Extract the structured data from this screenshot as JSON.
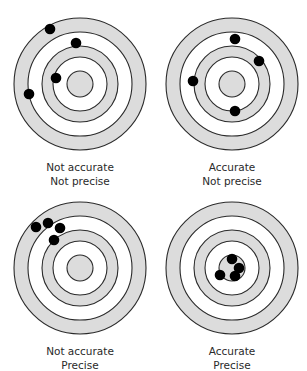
{
  "figure": {
    "colors": {
      "ring_fill": "#dcdcdc",
      "ring_gap": "#ffffff",
      "ring_stroke": "#2b2b2b",
      "dot": "#000000",
      "text": "#2a2a2a"
    },
    "rings": {
      "radii_px": [
        66,
        52,
        38,
        27,
        13
      ],
      "fills": [
        "shaded",
        "white",
        "shaded",
        "white",
        "shaded"
      ]
    },
    "panels": [
      {
        "id": "top-left",
        "center": [
          80,
          84
        ],
        "line1": "Not accurate",
        "line2": "Not precise",
        "accurate": false,
        "precise": false,
        "hits": [
          [
            -30,
            -55
          ],
          [
            -4,
            -41
          ],
          [
            -24,
            -6
          ],
          [
            -51,
            10
          ]
        ]
      },
      {
        "id": "top-right",
        "center": [
          232,
          84
        ],
        "line1": "Accurate",
        "line2": "Not precise",
        "accurate": true,
        "precise": false,
        "hits": [
          [
            3,
            -45
          ],
          [
            27,
            -23
          ],
          [
            -39,
            -3
          ],
          [
            3,
            27
          ]
        ]
      },
      {
        "id": "bottom-left",
        "center": [
          80,
          268
        ],
        "line1": "Not accurate",
        "line2": "Precise",
        "accurate": false,
        "precise": true,
        "hits": [
          [
            -44,
            -41
          ],
          [
            -32,
            -45
          ],
          [
            -20,
            -40
          ],
          [
            -26,
            -28
          ]
        ]
      },
      {
        "id": "bottom-right",
        "center": [
          232,
          268
        ],
        "line1": "Accurate",
        "line2": "Precise",
        "accurate": true,
        "precise": true,
        "hits": [
          [
            0,
            -9
          ],
          [
            7,
            0
          ],
          [
            -12,
            7
          ],
          [
            3,
            8
          ]
        ]
      }
    ]
  }
}
